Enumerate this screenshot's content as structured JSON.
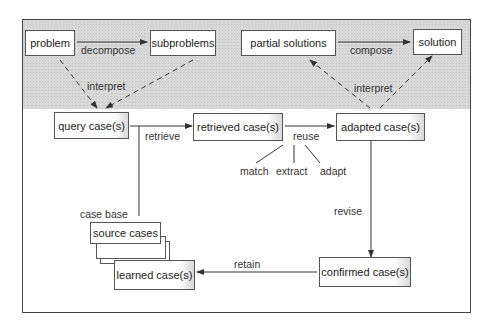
{
  "diagram": {
    "top_row": {
      "problem": "problem",
      "subproblems": "subproblems",
      "partial_solutions": "partial solutions",
      "solution": "solution",
      "decompose": "decompose",
      "compose": "compose",
      "interpret_left": "interpret",
      "interpret_right": "interpret"
    },
    "middle_row": {
      "query_cases": "query case(s)",
      "retrieved_cases": "retrieved case(s)",
      "adapted_cases": "adapted case(s)",
      "retrieve": "retrieve",
      "reuse": "reuse",
      "match": "match",
      "extract": "extract",
      "adapt": "adapt"
    },
    "bottom_row": {
      "case_base": "case base",
      "source_cases": "source cases",
      "learned_cases": "learned case(s)",
      "confirmed_cases": "confirmed case(s)",
      "revise": "revise",
      "retain": "retain"
    }
  }
}
